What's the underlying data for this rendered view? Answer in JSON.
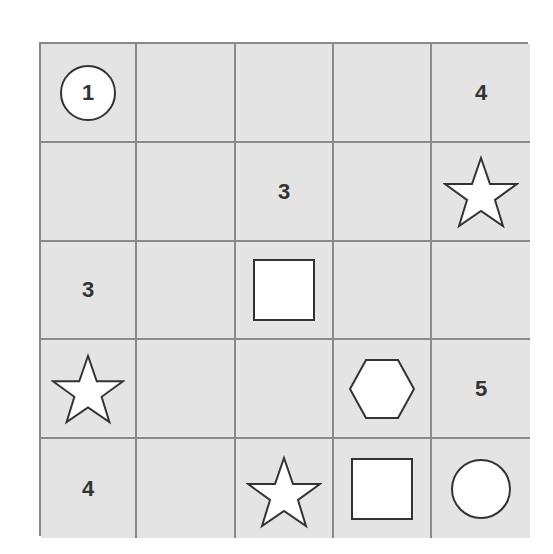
{
  "puzzle": {
    "rows": 5,
    "cols": 5,
    "colors": {
      "cell_bg": "#e4e4e4",
      "grid_line": "#8a8a8a",
      "shape_fill": "#ffffff",
      "shape_stroke": "#333333",
      "text": "#333333"
    },
    "cells": [
      [
        {
          "type": "circle-number",
          "value": "1"
        },
        {
          "type": "empty"
        },
        {
          "type": "empty"
        },
        {
          "type": "empty"
        },
        {
          "type": "number",
          "value": "4"
        }
      ],
      [
        {
          "type": "empty"
        },
        {
          "type": "empty"
        },
        {
          "type": "number",
          "value": "3"
        },
        {
          "type": "empty"
        },
        {
          "type": "star"
        }
      ],
      [
        {
          "type": "number",
          "value": "3"
        },
        {
          "type": "empty"
        },
        {
          "type": "square"
        },
        {
          "type": "empty"
        },
        {
          "type": "empty"
        }
      ],
      [
        {
          "type": "star"
        },
        {
          "type": "empty"
        },
        {
          "type": "empty"
        },
        {
          "type": "hexagon"
        },
        {
          "type": "number",
          "value": "5"
        }
      ],
      [
        {
          "type": "number",
          "value": "4"
        },
        {
          "type": "empty"
        },
        {
          "type": "star"
        },
        {
          "type": "square"
        },
        {
          "type": "circle"
        }
      ]
    ]
  }
}
